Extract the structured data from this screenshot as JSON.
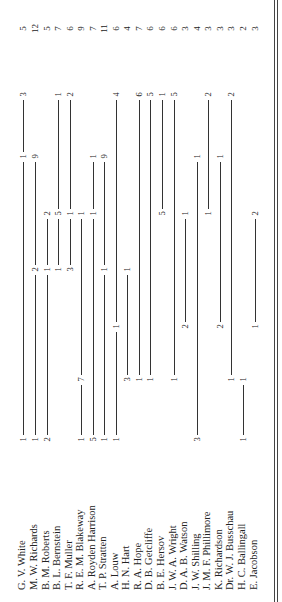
{
  "document": {
    "orientation": "rotated-90-counterclockwise",
    "columns_y": [
      440,
      380,
      327,
      270,
      214,
      157,
      95
    ],
    "total_y": 30,
    "rows": [
      {
        "name": "G. V. White",
        "x": 23,
        "points": [
          [
            0,
            "1"
          ],
          [
            5,
            "1"
          ],
          [
            6,
            "3"
          ]
        ],
        "total": "5"
      },
      {
        "name": "M. W. Richards",
        "x": 35,
        "points": [
          [
            0,
            "1"
          ],
          [
            3,
            "2"
          ],
          [
            5,
            "9"
          ]
        ],
        "total": "12"
      },
      {
        "name": "B. M. Roberts",
        "x": 47,
        "points": [
          [
            0,
            "2"
          ],
          [
            3,
            "1"
          ],
          [
            4,
            "2"
          ]
        ],
        "total": "5"
      },
      {
        "name": "B. L. Bernstein",
        "x": 58,
        "points": [
          [
            3,
            "1"
          ],
          [
            4,
            "5"
          ],
          [
            6,
            "1"
          ]
        ],
        "total": "7"
      },
      {
        "name": "T. F. Muller",
        "x": 70,
        "points": [
          [
            3,
            "3"
          ],
          [
            4,
            "1"
          ],
          [
            6,
            "2"
          ]
        ],
        "total": "6"
      },
      {
        "name": "R. E. M. Blakeway",
        "x": 81,
        "points": [
          [
            0,
            "1"
          ],
          [
            1,
            "7"
          ],
          [
            4,
            "1"
          ]
        ],
        "total": "9"
      },
      {
        "name": "A. Royden Harrison",
        "x": 93,
        "points": [
          [
            0,
            "5"
          ],
          [
            4,
            "1"
          ],
          [
            5,
            "1"
          ]
        ],
        "total": "7"
      },
      {
        "name": "T. P. Stratten",
        "x": 104,
        "points": [
          [
            0,
            "1"
          ],
          [
            3,
            "1"
          ],
          [
            5,
            "9"
          ]
        ],
        "total": "11"
      },
      {
        "name": "A. Louw",
        "x": 116,
        "points": [
          [
            0,
            "1"
          ],
          [
            2,
            "1"
          ],
          [
            6,
            "4"
          ]
        ],
        "total": "6"
      },
      {
        "name": "H. N. Hart",
        "x": 127,
        "points": [
          [
            1,
            "3"
          ],
          [
            3,
            "1"
          ]
        ],
        "total": "4"
      },
      {
        "name": "R. A. Hope",
        "x": 139,
        "points": [
          [
            1,
            "1"
          ],
          [
            6,
            "6"
          ]
        ],
        "total": "7"
      },
      {
        "name": "D. B. Getcliffe",
        "x": 150,
        "points": [
          [
            1,
            "1"
          ],
          [
            6,
            "5"
          ]
        ],
        "total": "6"
      },
      {
        "name": "B. E. Hersov",
        "x": 162,
        "points": [
          [
            4,
            "5"
          ],
          [
            6,
            "1"
          ]
        ],
        "total": "6"
      },
      {
        "name": "J. W. A. Wright",
        "x": 174,
        "points": [
          [
            1,
            "1"
          ],
          [
            6,
            "5"
          ]
        ],
        "total": "6"
      },
      {
        "name": "D. A. B. Watson",
        "x": 185,
        "points": [
          [
            2,
            "2"
          ],
          [
            4,
            "1"
          ]
        ],
        "total": "3"
      },
      {
        "name": "J. W. Shilling",
        "x": 197,
        "points": [
          [
            0,
            "3"
          ],
          [
            5,
            "1"
          ]
        ],
        "total": "4"
      },
      {
        "name": "J. M. F. Phillimore",
        "x": 208,
        "points": [
          [
            4,
            "1"
          ],
          [
            6,
            "2"
          ]
        ],
        "total": "3"
      },
      {
        "name": "K. Richardson",
        "x": 220,
        "points": [
          [
            2,
            "2"
          ],
          [
            5,
            "1"
          ]
        ],
        "total": "3"
      },
      {
        "name": "Dr. W. J. Busschau",
        "x": 231,
        "points": [
          [
            1,
            "1"
          ],
          [
            6,
            "2"
          ]
        ],
        "total": "3"
      },
      {
        "name": "H. C. Ballingall",
        "x": 243,
        "points": [
          [
            0,
            "1"
          ],
          [
            1,
            "1"
          ]
        ],
        "total": "2"
      },
      {
        "name": "E. Jacobson",
        "x": 255,
        "points": [
          [
            2,
            "1"
          ],
          [
            4,
            "2"
          ]
        ],
        "total": "3"
      }
    ]
  }
}
